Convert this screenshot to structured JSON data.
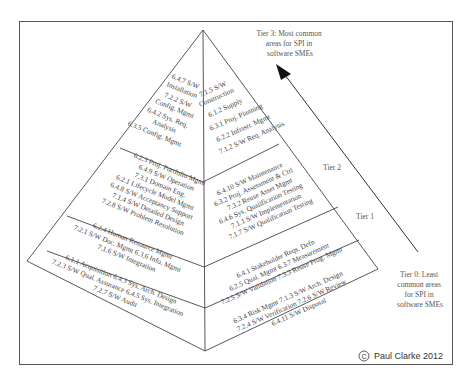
{
  "diagram": {
    "title_tier3": [
      "Tier 3: Most common",
      "areas for SPI in",
      "software SMEs"
    ],
    "title_tier0": [
      "Tier 0: Least",
      "common areas",
      "for SPI in",
      "software SMEs"
    ],
    "tier2_label": "Tier 2",
    "tier1_label": "Tier 1",
    "copyright": "Paul Clarke 2012",
    "copyright_symbol": "©",
    "arrow": {
      "direction": "up-left",
      "meaning": "increasing commonality of SPI areas"
    },
    "pyramid": {
      "left_face": {
        "tier3": [
          "6.4.7 S/W",
          "Installation",
          "7.2.2 S/W",
          "Config. Mgmt",
          "6.4.2 Sys. Req.",
          "Analysis",
          "6.3.5 Config. Mgmt"
        ],
        "tier2": [
          "6.2.3 Proj. Portfolio Mgmt",
          "6.4.9 S/W Operation",
          "7.3.1 Domain Eng.",
          "6.2.1 Lifecycle Model Mgmt",
          "6.4.8 S/W Acceptancy Support",
          "7.1.4 S/W Detailed Design",
          "7.2.8 S/W Problem Resolution"
        ],
        "tier1": [
          "6.2.4 Human Resource Mgmt",
          "7.2.1 S/W Doc. Mgmt 6.3.6 Info. Mgmt",
          "7.1.6 S/W Integration"
        ],
        "tier0": [
          "6.1.1 Acquisition 6.4.3 Sys. Arch. Design",
          "7.2.3 S/W Qual. Assurance 6.4.5 Sys. Integration",
          "7.2.7 S/W Audit"
        ]
      },
      "right_face": {
        "tier3": [
          "7.1.5 S/W",
          "Construction",
          "6.1.2 Supply",
          "6.3.1 Proj. Planning",
          "6.2.2 Infrastr. Mgmt",
          "7.1.2 S/W Req. Analysis"
        ],
        "tier2": [
          "6.4.10 S/W Maintenance",
          "6.3.2 Proj. Assessment & Ctrl",
          "7.3.2 Reuse Asset Mgmt",
          "6.4.6 Sys. Qualification Testing",
          "7.1.1 S/W Implementation",
          "7.1.7 S/W Qualification Testing"
        ],
        "tier1": [
          "6.4.1 Stakeholder Reqs. Defn",
          "6.2.5 Qual. Mgmt  6.3.7 Measurement",
          "7.2.5 S/W Validation  7.3.3 Reuse Prog. Mgmt"
        ],
        "tier0": [
          "6.3.4 Risk Mgmt  7.1.3 S/W Arch. Design",
          "7.2.4 S/W Verification 7.2.6 S/W Review",
          "6.4.11 S/W Disposal"
        ]
      }
    },
    "colors": {
      "line": "#444444",
      "text": "#444444",
      "background": "#ffffff",
      "arrow": "#222222"
    }
  }
}
